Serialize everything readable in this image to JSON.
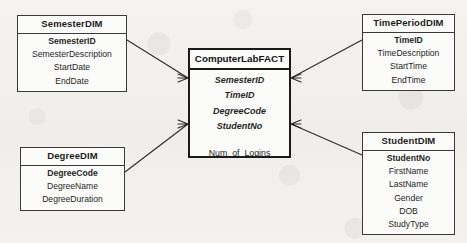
{
  "diagram": {
    "type": "star-schema-er-diagram",
    "background_color": "#f2f1ee",
    "line_color": "#2b2b29",
    "box_fill": "#fbfbfa",
    "box_border": "#3a3a38",
    "fact_border": "#1b1b19"
  },
  "fact_table": {
    "name": "ComputerLabFACT",
    "foreign_keys": [
      {
        "label": "SemesterID"
      },
      {
        "label": "TimeID"
      },
      {
        "label": "DegreeCode"
      },
      {
        "label": "StudentNo"
      }
    ],
    "measures": [
      {
        "label": "Num_of_Logins"
      }
    ]
  },
  "dimensions": [
    {
      "id": "semester",
      "name": "SemesterDIM",
      "key": "SemesterID",
      "attributes": [
        {
          "label": "SemesterDescription"
        },
        {
          "label": "StartDate"
        },
        {
          "label": "EndDate"
        }
      ]
    },
    {
      "id": "timeperiod",
      "name": "TimePeriodDIM",
      "key": "TimeID",
      "attributes": [
        {
          "label": "TimeDescription"
        },
        {
          "label": "StartTime"
        },
        {
          "label": "EndTime"
        }
      ]
    },
    {
      "id": "degree",
      "name": "DegreeDIM",
      "key": "DegreeCode",
      "attributes": [
        {
          "label": "DegreeName"
        },
        {
          "label": "DegreeDuration"
        }
      ]
    },
    {
      "id": "student",
      "name": "StudentDIM",
      "key": "StudentNo",
      "attributes": [
        {
          "label": "FirstName"
        },
        {
          "label": "LastName"
        },
        {
          "label": "Gender"
        },
        {
          "label": "DOB"
        },
        {
          "label": "StudyType"
        }
      ]
    }
  ],
  "relationships": [
    {
      "id": "rel-semester-fact",
      "from": "SemesterDIM",
      "to": "ComputerLabFACT",
      "notation": "crows-foot"
    },
    {
      "id": "rel-timeperiod-fact",
      "from": "TimePeriodDIM",
      "to": "ComputerLabFACT",
      "notation": "crows-foot"
    },
    {
      "id": "rel-degree-fact",
      "from": "DegreeDIM",
      "to": "ComputerLabFACT",
      "notation": "crows-foot"
    },
    {
      "id": "rel-student-fact",
      "from": "StudentDIM",
      "to": "ComputerLabFACT",
      "notation": "crows-foot"
    }
  ]
}
